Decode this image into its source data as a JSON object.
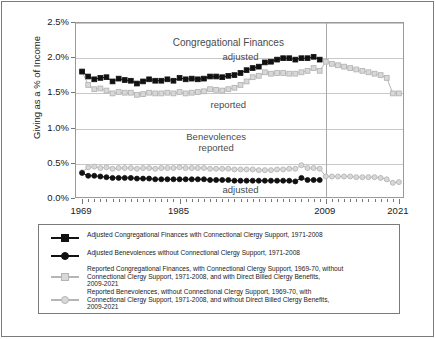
{
  "chart_data": {
    "type": "line",
    "title": "",
    "xlabel": "",
    "ylabel": "Giving as a % of Income",
    "xlim": [
      1968,
      2022
    ],
    "ylim": [
      0.0,
      2.5
    ],
    "ytick_labels": [
      "0.0%",
      "0.5%",
      "1.0%",
      "1.5%",
      "2.0%",
      "2.5%"
    ],
    "ytick_values": [
      0.0,
      0.5,
      1.0,
      1.5,
      2.0,
      2.5
    ],
    "xtick_labels": [
      "1969",
      "1985",
      "2009",
      "2021"
    ],
    "xtick_values": [
      1969,
      1985,
      2009,
      2021
    ],
    "grid": "horizontal",
    "legend_position": "below-plot",
    "reference_line_x": 2009,
    "annotations": [
      {
        "text": "Congregational Finances",
        "x": 1993,
        "y": 2.22
      },
      {
        "text": "adjusted",
        "x": 1995,
        "y": 2.02
      },
      {
        "text": "reported",
        "x": 1993,
        "y": 1.33
      },
      {
        "text": "Benevolences",
        "x": 1991,
        "y": 0.88
      },
      {
        "text": "reported",
        "x": 1991,
        "y": 0.73
      },
      {
        "text": "adjusted",
        "x": 1995,
        "y": 0.13
      }
    ],
    "series": [
      {
        "name": "Adjusted Congregational Finances",
        "marker": "square",
        "color": "#111111",
        "x": [
          1969,
          1970,
          1971,
          1972,
          1973,
          1974,
          1975,
          1976,
          1977,
          1978,
          1979,
          1980,
          1981,
          1982,
          1983,
          1984,
          1985,
          1986,
          1987,
          1988,
          1989,
          1990,
          1991,
          1992,
          1993,
          1994,
          1995,
          1996,
          1997,
          1998,
          1999,
          2000,
          2001,
          2002,
          2003,
          2004,
          2005,
          2006,
          2007,
          2008
        ],
        "values": [
          1.81,
          1.74,
          1.7,
          1.72,
          1.73,
          1.67,
          1.71,
          1.69,
          1.68,
          1.64,
          1.67,
          1.7,
          1.68,
          1.68,
          1.7,
          1.68,
          1.72,
          1.7,
          1.71,
          1.7,
          1.71,
          1.74,
          1.74,
          1.73,
          1.75,
          1.76,
          1.79,
          1.83,
          1.86,
          1.88,
          1.94,
          1.95,
          1.98,
          2.0,
          2.0,
          1.98,
          2.0,
          2.0,
          2.02,
          1.98
        ]
      },
      {
        "name": "Adjusted Benevolences",
        "marker": "circle",
        "color": "#111111",
        "x": [
          1969,
          1970,
          1971,
          1972,
          1973,
          1974,
          1975,
          1976,
          1977,
          1978,
          1979,
          1980,
          1981,
          1982,
          1983,
          1984,
          1985,
          1986,
          1987,
          1988,
          1989,
          1990,
          1991,
          1992,
          1993,
          1994,
          1995,
          1996,
          1997,
          1998,
          1999,
          2000,
          2001,
          2002,
          2003,
          2004,
          2005,
          2006,
          2007,
          2008
        ],
        "values": [
          0.37,
          0.33,
          0.33,
          0.32,
          0.31,
          0.3,
          0.3,
          0.3,
          0.3,
          0.29,
          0.29,
          0.29,
          0.28,
          0.28,
          0.28,
          0.28,
          0.28,
          0.28,
          0.28,
          0.28,
          0.28,
          0.27,
          0.27,
          0.27,
          0.27,
          0.26,
          0.26,
          0.26,
          0.26,
          0.26,
          0.26,
          0.26,
          0.26,
          0.26,
          0.26,
          0.25,
          0.3,
          0.27,
          0.27,
          0.27
        ]
      },
      {
        "name": "Reported Congregational Finances",
        "marker": "square",
        "color": "#b5b5b5",
        "x": [
          1969,
          1970,
          1971,
          1972,
          1973,
          1974,
          1975,
          1976,
          1977,
          1978,
          1979,
          1980,
          1981,
          1982,
          1983,
          1984,
          1985,
          1986,
          1987,
          1988,
          1989,
          1990,
          1991,
          1992,
          1993,
          1994,
          1995,
          1996,
          1997,
          1998,
          1999,
          2000,
          2001,
          2002,
          2003,
          2004,
          2005,
          2006,
          2007,
          2008,
          2009,
          2010,
          2011,
          2012,
          2013,
          2014,
          2015,
          2016,
          2017,
          2018,
          2019,
          2020,
          2021
        ],
        "values": [
          1.81,
          1.62,
          1.56,
          1.57,
          1.54,
          1.5,
          1.52,
          1.51,
          1.51,
          1.48,
          1.49,
          1.51,
          1.5,
          1.5,
          1.51,
          1.5,
          1.52,
          1.5,
          1.51,
          1.52,
          1.53,
          1.56,
          1.55,
          1.54,
          1.56,
          1.58,
          1.62,
          1.67,
          1.73,
          1.75,
          1.8,
          1.78,
          1.79,
          1.79,
          1.78,
          1.78,
          1.8,
          1.82,
          1.86,
          1.82,
          1.95,
          1.92,
          1.9,
          1.88,
          1.86,
          1.84,
          1.82,
          1.8,
          1.78,
          1.76,
          1.72,
          1.5,
          1.5
        ]
      },
      {
        "name": "Reported Benevolences",
        "marker": "circle",
        "color": "#b5b5b5",
        "x": [
          1969,
          1970,
          1971,
          1972,
          1973,
          1974,
          1975,
          1976,
          1977,
          1978,
          1979,
          1980,
          1981,
          1982,
          1983,
          1984,
          1985,
          1986,
          1987,
          1988,
          1989,
          1990,
          1991,
          1992,
          1993,
          1994,
          1995,
          1996,
          1997,
          1998,
          1999,
          2000,
          2001,
          2002,
          2003,
          2004,
          2005,
          2006,
          2007,
          2008,
          2009,
          2010,
          2011,
          2012,
          2013,
          2014,
          2015,
          2016,
          2017,
          2018,
          2019,
          2020,
          2021
        ],
        "values": [
          0.38,
          0.45,
          0.46,
          0.44,
          0.45,
          0.43,
          0.44,
          0.44,
          0.44,
          0.43,
          0.44,
          0.44,
          0.43,
          0.44,
          0.44,
          0.44,
          0.45,
          0.44,
          0.44,
          0.44,
          0.44,
          0.43,
          0.43,
          0.43,
          0.43,
          0.42,
          0.42,
          0.42,
          0.42,
          0.41,
          0.41,
          0.41,
          0.42,
          0.42,
          0.43,
          0.43,
          0.48,
          0.44,
          0.44,
          0.43,
          0.32,
          0.32,
          0.32,
          0.32,
          0.32,
          0.31,
          0.31,
          0.31,
          0.31,
          0.3,
          0.28,
          0.23,
          0.24
        ]
      }
    ],
    "legend": [
      {
        "marker": "square",
        "color": "#111111",
        "lines": [
          "Adjusted Congregational Finances with Connectional Clergy Support, 1971-2008"
        ]
      },
      {
        "marker": "circle",
        "color": "#111111",
        "lines": [
          "Adjusted Benevolences without Connectional Clergy Support, 1971-2008"
        ]
      },
      {
        "marker": "square",
        "color": "#b5b5b5",
        "lines": [
          "Reported Congregational Finances, with Connectional Clergy Support,  1969-70, without",
          "Connectional Clergy Support, 1971-2008, and with  Direct Billed Clergy Benefits,",
          "2009-2021"
        ]
      },
      {
        "marker": "circle",
        "color": "#b5b5b5",
        "lines": [
          "Reported Benevolences, without Connectional Clergy Support, 1969-70, with",
          "Connectional Clergy Support, 1971-2008, and without Direct Billed Clergy Benefits,",
          "2009-2021"
        ]
      }
    ]
  }
}
